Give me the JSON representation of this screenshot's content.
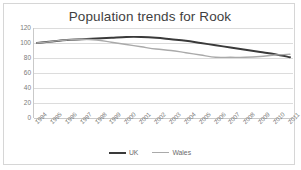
{
  "chart_data": {
    "type": "line",
    "title": "Population trends for Rook",
    "xlabel": "",
    "ylabel": "",
    "ylim": [
      0,
      120
    ],
    "ytick_step": 20,
    "yticks": [
      120,
      100,
      80,
      60,
      40,
      20,
      0
    ],
    "grid": true,
    "legend_position": "bottom",
    "categories": [
      "1994",
      "1995",
      "1996",
      "1997",
      "1998",
      "1999",
      "2000",
      "2001",
      "2002",
      "2003",
      "2004",
      "2005",
      "2006",
      "2007",
      "2008",
      "2009",
      "2010",
      "2011"
    ],
    "series": [
      {
        "name": "UK",
        "color": "#3a3a3a",
        "values": [
          100,
          102,
          104,
          105,
          106,
          107,
          108,
          108,
          107,
          105,
          103,
          100,
          97,
          94,
          91,
          88,
          85,
          81
        ]
      },
      {
        "name": "Wales",
        "color": "#aaaaaa",
        "values": [
          100,
          102,
          104,
          105,
          104,
          101,
          98,
          95,
          92,
          90,
          87,
          84,
          81,
          81,
          81,
          82,
          84,
          85
        ]
      }
    ]
  },
  "legend": {
    "items": [
      {
        "label": "UK"
      },
      {
        "label": "Wales"
      }
    ]
  }
}
